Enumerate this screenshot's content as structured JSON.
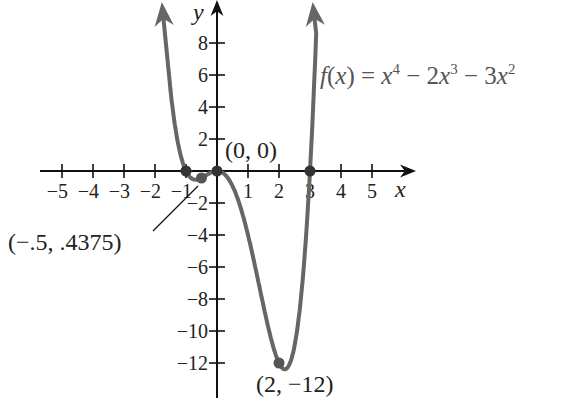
{
  "chart_data": {
    "type": "line",
    "title": "",
    "function_label": "f(x) = x^4 - 2x^3 - 3x^2",
    "function_label_parts": {
      "lhs": "f(x) = ",
      "t1_base": "x",
      "t1_exp": "4",
      "op1": " − 2",
      "t2_base": "x",
      "t2_exp": "3",
      "op2": " − 3",
      "t3_base": "x",
      "t3_exp": "2"
    },
    "xlabel": "x",
    "ylabel": "y",
    "xlim": [
      -5.5,
      6
    ],
    "ylim": [
      -13.5,
      10
    ],
    "x_ticks": [
      -5,
      -4,
      -3,
      -2,
      -1,
      1,
      2,
      3,
      4,
      5
    ],
    "x_tick_labels": [
      "−5",
      "−4",
      "−3",
      "−2",
      "−1",
      "1",
      "2",
      "3",
      "4",
      "5"
    ],
    "y_ticks": [
      8,
      6,
      4,
      2,
      -2,
      -4,
      -6,
      -8,
      -10,
      -12
    ],
    "y_tick_labels": [
      "8",
      "6",
      "4",
      "2",
      "−2",
      "−4",
      "−6",
      "−8",
      "−10",
      "−12"
    ],
    "grid": false,
    "series": [
      {
        "name": "f(x) = x^4 - 2x^3 - 3x^2",
        "color": "#666666",
        "x": [
          -1.6,
          -1.4,
          -1.2,
          -1.0,
          -0.8,
          -0.6,
          -0.5,
          -0.4,
          -0.2,
          0.0,
          0.25,
          0.5,
          0.75,
          1.0,
          1.25,
          1.5,
          1.75,
          2.0,
          2.25,
          2.5,
          2.75,
          3.0,
          3.2,
          3.4
        ],
        "y": [
          6.71,
          2.41,
          0.19,
          0.0,
          -0.51,
          -0.52,
          -0.4375,
          -0.35,
          -0.1,
          0.0,
          -0.21,
          -0.94,
          -2.21,
          -4.0,
          -6.16,
          -8.44,
          -10.45,
          -12.0,
          -12.54,
          -11.56,
          -8.27,
          0.0,
          7.37,
          19.5
        ]
      }
    ],
    "points": [
      {
        "x": -1,
        "y": 0,
        "label": ""
      },
      {
        "x": -0.5,
        "y": -0.4375,
        "label": "(−.5, .4375)"
      },
      {
        "x": 0,
        "y": 0,
        "label": "(0, 0)"
      },
      {
        "x": 2,
        "y": -12,
        "label": "(2, −12)"
      },
      {
        "x": 3,
        "y": 0,
        "label": ""
      }
    ],
    "annotations": [
      "(0, 0)",
      "(−.5, .4375)",
      "(2, −12)"
    ],
    "legend": "none"
  }
}
